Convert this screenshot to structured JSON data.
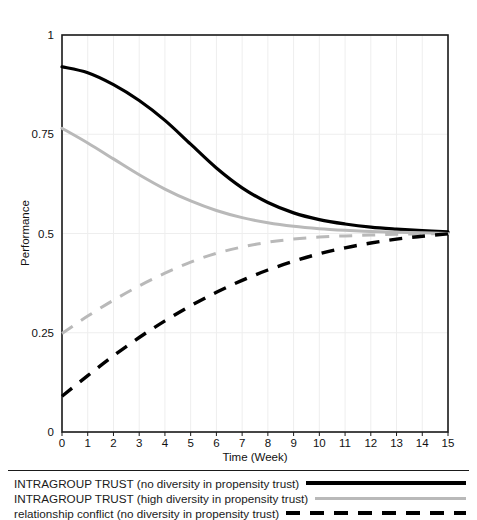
{
  "chart_data": {
    "type": "line",
    "title": "",
    "xlabel": "Time (Week)",
    "ylabel": "Performance",
    "xlim": [
      0,
      15
    ],
    "ylim": [
      0,
      1
    ],
    "xticks": [
      "0",
      "1",
      "2",
      "3",
      "4",
      "5",
      "6",
      "7",
      "8",
      "9",
      "10",
      "11",
      "12",
      "13",
      "14",
      "15"
    ],
    "yticks": [
      "0",
      "0.25",
      "0.5",
      "0.75",
      "1"
    ],
    "grid": "vertical-and-horizontal-faint",
    "legend_position": "below-plot",
    "x": [
      0,
      1,
      2,
      3,
      4,
      5,
      6,
      7,
      8,
      9,
      10,
      11,
      12,
      13,
      14,
      15
    ],
    "series": [
      {
        "name": "INTRAGROUP TRUST (no diversity in propensity trust)",
        "style": "solid",
        "color": "#000000",
        "width": 3.2,
        "values": [
          0.92,
          0.905,
          0.875,
          0.835,
          0.785,
          0.725,
          0.665,
          0.615,
          0.578,
          0.552,
          0.535,
          0.524,
          0.516,
          0.511,
          0.507,
          0.504
        ]
      },
      {
        "name": "INTRAGROUP TRUST (high diversity in propensity trust)",
        "style": "solid",
        "color": "#b9b9b9",
        "width": 3.0,
        "values": [
          0.765,
          0.728,
          0.688,
          0.648,
          0.612,
          0.582,
          0.558,
          0.54,
          0.527,
          0.518,
          0.512,
          0.508,
          0.505,
          0.503,
          0.502,
          0.5
        ]
      },
      {
        "name": "relationship conflict (high diversity in propensity trust)",
        "style": "dashed",
        "color": "#b9b9b9",
        "width": 3.0,
        "values": [
          0.248,
          0.292,
          0.332,
          0.368,
          0.4,
          0.428,
          0.45,
          0.466,
          0.478,
          0.486,
          0.491,
          0.494,
          0.496,
          0.498,
          0.499,
          0.5
        ]
      },
      {
        "name": "relationship conflict (no diversity in propensity trust)",
        "style": "dashed",
        "color": "#000000",
        "width": 3.4,
        "values": [
          0.09,
          0.142,
          0.192,
          0.238,
          0.28,
          0.318,
          0.352,
          0.382,
          0.408,
          0.43,
          0.449,
          0.464,
          0.476,
          0.486,
          0.493,
          0.499
        ]
      }
    ],
    "legend": [
      {
        "label": "INTRAGROUP TRUST (no diversity in propensity trust)",
        "style": "solid",
        "color": "#000000"
      },
      {
        "label": "INTRAGROUP TRUST (high diversity in propensity trust)",
        "style": "solid",
        "color": "#b9b9b9"
      },
      {
        "label": "relationship conflict (no diversity in propensity trust)",
        "style": "dashed",
        "color": "#000000"
      }
    ]
  }
}
